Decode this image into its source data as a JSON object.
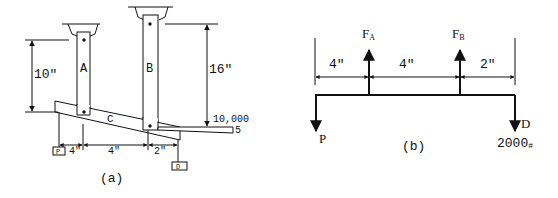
{
  "figure_a": {
    "caption": "(a)",
    "labels": {
      "member_a": "A",
      "member_b": "B",
      "member_c": "C",
      "load_p": "P",
      "load_d": "D"
    },
    "dimensions": {
      "height_a": "10\"",
      "height_b": "16\"",
      "span_1": "4\"",
      "span_2": "4\"",
      "span_3": "2\""
    },
    "annotation": {
      "line1": "10,000",
      "line2": "5"
    }
  },
  "figure_b": {
    "caption": "(b)",
    "forces": {
      "fa": "F",
      "fa_sub": "A",
      "fb": "F",
      "fb_sub": "B",
      "p": "P",
      "d": "D",
      "d_value": "2000",
      "d_unit": "#"
    },
    "dimensions": {
      "span_1": "4\"",
      "span_2": "4\"",
      "span_3": "2\""
    }
  }
}
